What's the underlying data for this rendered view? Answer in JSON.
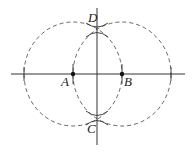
{
  "diagram": {
    "points": [
      {
        "name": "A",
        "label": "A",
        "x": 73,
        "y": 74
      },
      {
        "name": "B",
        "label": "B",
        "x": 122,
        "y": 74
      },
      {
        "name": "C",
        "label": "C",
        "x": 97,
        "y": 118
      },
      {
        "name": "D",
        "label": "D",
        "x": 97,
        "y": 30
      }
    ],
    "circles": [
      {
        "center": "A",
        "style": "dashed"
      },
      {
        "center": "B",
        "style": "dashed"
      }
    ],
    "lines": [
      {
        "name": "horizontal-line-AB"
      },
      {
        "name": "vertical-line-CD"
      }
    ],
    "colors": {
      "stroke": "#333333",
      "dashed": "#555555"
    }
  }
}
